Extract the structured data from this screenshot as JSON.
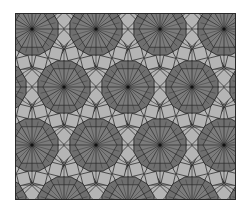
{
  "figure": {
    "colors": {
      "background": "#ffffff",
      "rosette_fill": "#6f6f6f",
      "rosette_inner": "#7c7c7c",
      "square_fill": "#b5b5b5",
      "triangle_fill": "#e6e6e6",
      "line": "#2a2a2a"
    },
    "lattice": {
      "spacing_x": 64,
      "spacing_y": 58,
      "row_offset": 32,
      "origin_x": 17,
      "origin_y": 16,
      "rows": 4,
      "cols": 5,
      "rosette_radius": 27
    }
  }
}
